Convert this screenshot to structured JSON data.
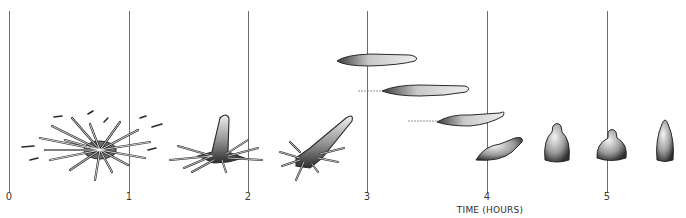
{
  "figure": {
    "axis": {
      "title": "TIME (HOURS)",
      "ticks": [
        {
          "label": "0",
          "x": 9
        },
        {
          "label": "1",
          "x": 129
        },
        {
          "label": "2",
          "x": 248
        },
        {
          "label": "3",
          "x": 367
        },
        {
          "label": "4",
          "x": 487
        },
        {
          "label": "5",
          "x": 607
        }
      ]
    },
    "stages": [
      {
        "name": "spread-stellate-cell",
        "x": 92,
        "y": 148
      },
      {
        "name": "cell-with-upright-process",
        "x": 213,
        "y": 150
      },
      {
        "name": "cell-with-leaning-process",
        "x": 316,
        "y": 150
      },
      {
        "name": "elongated-cell-top",
        "x": 378,
        "y": 58
      },
      {
        "name": "elongated-cell-middle",
        "x": 430,
        "y": 90
      },
      {
        "name": "elongated-cell-trailing",
        "x": 470,
        "y": 117
      },
      {
        "name": "retracting-cell",
        "x": 502,
        "y": 150
      },
      {
        "name": "rounded-cell-a",
        "x": 557,
        "y": 150
      },
      {
        "name": "rounded-cell-b",
        "x": 612,
        "y": 150
      },
      {
        "name": "rounded-cell-c",
        "x": 667,
        "y": 146
      }
    ],
    "colors": {
      "ink": "#2a2a2a",
      "shade": "#555555",
      "line": "#6b6b6b",
      "background": "#ffffff"
    }
  }
}
